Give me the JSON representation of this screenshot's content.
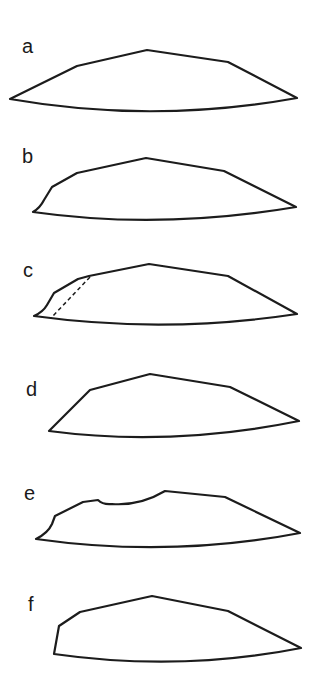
{
  "figure": {
    "line_color": "#1c1c1c",
    "background": "#ffffff",
    "panels": [
      {
        "label": "a",
        "label_pos": [
          22,
          36
        ],
        "path": "M10,99 L77,66 L147,50 L228,62 L297,98 Q152,124 10,99 Z",
        "dashed": null
      },
      {
        "label": "b",
        "label_pos": [
          22,
          146
        ],
        "path": "M33,212 Q40,208 44,200 L52,187 L77,173 L146,158 L224,171 L296,207 Q160,230 33,212 Z",
        "dashed": null
      },
      {
        "label": "c",
        "label_pos": [
          23,
          260
        ],
        "path": "M34,316 Q43,312 47,305 L54,293 L78,279 L89,276 L149,264 L228,276 L297,314 Q165,334 34,316 Z",
        "dashed": "M90,277 L51,318"
      },
      {
        "label": "d",
        "label_pos": [
          26,
          379
        ],
        "path": "M49,431 L90,390 L150,374 L230,387 L299,421 Q170,447 49,431 Z",
        "dashed": null
      },
      {
        "label": "e",
        "label_pos": [
          24,
          483
        ],
        "path": "M36,539 Q48,533 52,524 L55,516 L83,502 L98,500 Q103,505 112,504 Q140,506 165,491 L225,497 L300,533 Q170,558 36,539 Z",
        "dashed": null
      },
      {
        "label": "f",
        "label_pos": [
          28,
          594
        ],
        "path": "M54,654 L59,626 L80,612 L152,596 L228,611 L301,648 Q180,672 54,654 Z",
        "dashed": null
      }
    ]
  }
}
